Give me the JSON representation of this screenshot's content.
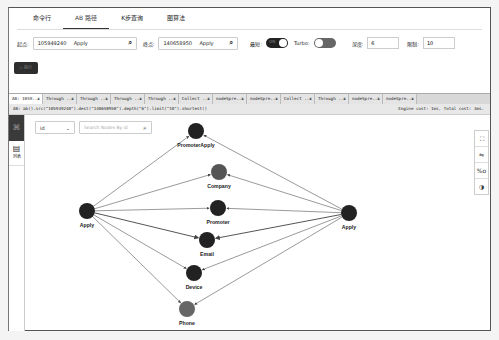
{
  "top_tabs": [
    {
      "label": "命令行",
      "active": false
    },
    {
      "label": "AB 路径",
      "active": true
    },
    {
      "label": "K步查询",
      "active": false
    },
    {
      "label": "图算法",
      "active": false
    }
  ],
  "params": {
    "start_label": "起点:",
    "start_value": "10594​9240",
    "start_type": "Apply",
    "end_label": "终点:",
    "end_value": "140658950",
    "end_type": "Apply",
    "shortest_label": "最短:",
    "shortest_toggle": "ON",
    "turbo_label": "Turbo:",
    "depth_label": "深度:",
    "depth_value": "6",
    "limit_label": "限制:",
    "limit_value": "10"
  },
  "run_button": "▷ 执行",
  "query_tabs": [
    {
      "label": "AB: 1059..",
      "active": true
    },
    {
      "label": "Through ..",
      "active": false
    },
    {
      "label": "Through ..",
      "active": false
    },
    {
      "label": "Through ..",
      "active": false
    },
    {
      "label": "Through ..",
      "active": false
    },
    {
      "label": "Collect ..",
      "active": false
    },
    {
      "label": "nodeSpre..",
      "active": false
    },
    {
      "label": "nodeSpre..",
      "active": false
    },
    {
      "label": "Collect ..",
      "active": false
    },
    {
      "label": "Through ..",
      "active": false
    },
    {
      "label": "nodeSpre..",
      "active": false
    },
    {
      "label": "nodeSpre..",
      "active": false
    }
  ],
  "query_bar": {
    "query": "AB: ab().src(\"105949240\").dest(\"140658950\").depth(\"6\").limit(\"10\").shortest()",
    "cost": "Engine cost: 1ms, Total cost: 3ms."
  },
  "side": {
    "graph_icon": "⌘",
    "list_label": "列表",
    "list_icon": "▤"
  },
  "filter": {
    "select_value": "id",
    "search_placeholder": "Search Nodes By id"
  },
  "tools": [
    {
      "name": "fullscreen-icon",
      "glyph": "⛶"
    },
    {
      "name": "link-icon",
      "glyph": "⇋"
    },
    {
      "name": "zoom-ratio-icon",
      "glyph": "%o"
    },
    {
      "name": "theme-icon",
      "glyph": "◑"
    }
  ],
  "graph": {
    "nodes": [
      {
        "id": "apply_src",
        "label": "Apply",
        "x": 86,
        "y": 210,
        "color": "#222222"
      },
      {
        "id": "apply_dst",
        "label": "Apply",
        "x": 348,
        "y": 212,
        "color": "#222222"
      },
      {
        "id": "promoterapply",
        "label": "PromoterApply",
        "x": 195,
        "y": 130,
        "color": "#222222"
      },
      {
        "id": "company",
        "label": "Company",
        "x": 218,
        "y": 171,
        "color": "#555555"
      },
      {
        "id": "promoter",
        "label": "Promoter",
        "x": 217,
        "y": 207,
        "color": "#222222"
      },
      {
        "id": "email",
        "label": "Email",
        "x": 206,
        "y": 239,
        "color": "#222222"
      },
      {
        "id": "device",
        "label": "Device",
        "x": 193,
        "y": 272,
        "color": "#222222"
      },
      {
        "id": "phone",
        "label": "Phone",
        "x": 186,
        "y": 308,
        "color": "#666666"
      }
    ]
  }
}
